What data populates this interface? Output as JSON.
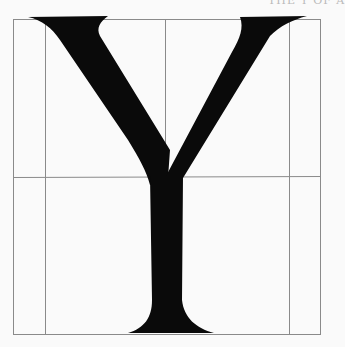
{
  "figure": {
    "letter": "Y",
    "top_fragment": "THE Y OF A",
    "colors": {
      "glyph": "#0a0a0a",
      "grid": "#8a8a8a",
      "background": "#fafafa"
    }
  }
}
